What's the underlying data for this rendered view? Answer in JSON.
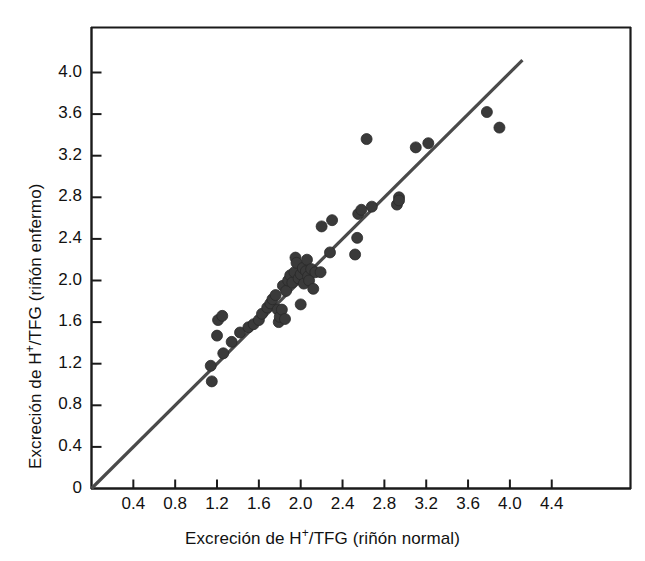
{
  "chart_data": {
    "type": "scatter",
    "title": "",
    "xlabel": "Excreción de H+/TFG (riñón normal)",
    "ylabel": "Excreción de H+/TFG (riñón enfermo)",
    "xlabel_parts": {
      "pre": "Excreción de H",
      "sup": "+",
      "post": "/TFG (riñón normal)"
    },
    "ylabel_parts": {
      "pre": "Excreción de H",
      "sup": "+",
      "post": "/TFG (riñón enfermo)"
    },
    "xlim": [
      0,
      4.7
    ],
    "ylim": [
      0,
      4.25
    ],
    "grid": false,
    "legend": "none",
    "marker_color": "#3a3a3a",
    "marker_size_px": 11,
    "line_color": "#4a4a4a",
    "axis_color": "#1a1a1a",
    "xticks": [
      0.4,
      0.8,
      1.2,
      1.6,
      2.0,
      2.4,
      2.8,
      3.2,
      3.6,
      4.0,
      4.4
    ],
    "xtick_labels": [
      "0.4",
      "0.8",
      "1.2",
      "1.6",
      "2.0",
      "2.4",
      "2.8",
      "3.2",
      "3.6",
      "4.0",
      "4.4"
    ],
    "yticks": [
      0,
      0.4,
      0.8,
      1.2,
      1.6,
      2.0,
      2.4,
      2.8,
      3.2,
      3.6,
      4.0
    ],
    "ytick_labels": [
      "0",
      "0.4",
      "0.8",
      "1.2",
      "1.6",
      "2.0",
      "2.4",
      "2.8",
      "3.2",
      "3.6",
      "4.0"
    ],
    "reference_line": {
      "name": "identity-line",
      "description": "line of identity y = x",
      "x0": 0.0,
      "y0": 0.0,
      "x1": 4.12,
      "y1": 4.12
    },
    "series": [
      {
        "name": "pacientes",
        "points": [
          [
            1.14,
            1.18
          ],
          [
            1.15,
            1.03
          ],
          [
            1.2,
            1.47
          ],
          [
            1.21,
            1.62
          ],
          [
            1.25,
            1.66
          ],
          [
            1.26,
            1.3
          ],
          [
            1.34,
            1.41
          ],
          [
            1.42,
            1.5
          ],
          [
            1.5,
            1.55
          ],
          [
            1.55,
            1.58
          ],
          [
            1.6,
            1.62
          ],
          [
            1.63,
            1.68
          ],
          [
            1.68,
            1.74
          ],
          [
            1.71,
            1.78
          ],
          [
            1.73,
            1.82
          ],
          [
            1.76,
            1.86
          ],
          [
            1.78,
            1.72
          ],
          [
            1.79,
            1.6
          ],
          [
            1.8,
            1.65
          ],
          [
            1.82,
            1.72
          ],
          [
            1.83,
            1.95
          ],
          [
            1.85,
            1.63
          ],
          [
            1.86,
            1.9
          ],
          [
            1.88,
            2.0
          ],
          [
            1.9,
            2.05
          ],
          [
            1.92,
            1.98
          ],
          [
            1.94,
            2.08
          ],
          [
            1.95,
            2.22
          ],
          [
            1.96,
            2.17
          ],
          [
            1.98,
            2.02
          ],
          [
            2.0,
            1.77
          ],
          [
            2.0,
            2.06
          ],
          [
            2.02,
            2.12
          ],
          [
            2.03,
            1.97
          ],
          [
            2.05,
            2.09
          ],
          [
            2.06,
            2.2
          ],
          [
            2.07,
            2.04
          ],
          [
            2.08,
            2.0
          ],
          [
            2.1,
            2.11
          ],
          [
            2.12,
            1.92
          ],
          [
            2.14,
            2.08
          ],
          [
            2.19,
            2.08
          ],
          [
            2.2,
            2.52
          ],
          [
            2.28,
            2.27
          ],
          [
            2.3,
            2.58
          ],
          [
            2.52,
            2.25
          ],
          [
            2.54,
            2.41
          ],
          [
            2.55,
            2.64
          ],
          [
            2.58,
            2.68
          ],
          [
            2.63,
            3.36
          ],
          [
            2.68,
            2.71
          ],
          [
            2.92,
            2.73
          ],
          [
            2.94,
            2.8
          ],
          [
            2.94,
            2.77
          ],
          [
            3.1,
            3.28
          ],
          [
            3.22,
            3.32
          ],
          [
            3.78,
            3.62
          ],
          [
            3.9,
            3.47
          ]
        ]
      }
    ]
  }
}
